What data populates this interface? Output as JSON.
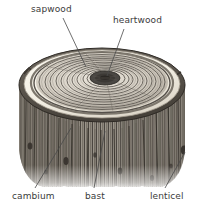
{
  "figure": {
    "style": "grayscale engraving / hatched line illustration",
    "background_color": "#ffffff",
    "width": 203,
    "height": 212
  },
  "labels": [
    {
      "id": "sapwood",
      "text": "sapwood",
      "position": "top-left",
      "leader_from": [
        63,
        18
      ],
      "leader_to": [
        86,
        67
      ]
    },
    {
      "id": "heartwood",
      "text": "heartwood",
      "position": "top-right",
      "leader_from": [
        124,
        29
      ],
      "leader_to": [
        107,
        76
      ]
    },
    {
      "id": "cambium",
      "text": "cambium",
      "position": "bottom-left",
      "leader_from": [
        35,
        188
      ],
      "leader_to": [
        71,
        128
      ]
    },
    {
      "id": "bast",
      "text": "bast",
      "position": "bottom-center",
      "leader_from": [
        94,
        188
      ],
      "leader_to": [
        105,
        131
      ]
    },
    {
      "id": "lenticel",
      "text": "lenticel",
      "position": "bottom-right",
      "leader_from": [
        165,
        188
      ],
      "leader_to": [
        185,
        152
      ]
    }
  ],
  "anatomy": {
    "heartwood": {
      "description": "dark elliptical core at centre of cut face",
      "center": [
        105,
        78
      ],
      "radius_x": 15,
      "radius_y": 7,
      "color": "#4a4743"
    },
    "sapwood": {
      "description": "pale concentric growth rings surrounding the heartwood",
      "ring_count": 11,
      "color": "#d9d4cb"
    },
    "cambium": {
      "description": "bright cream band at the outer rim of the cut face",
      "color": "#f4f0e6"
    },
    "bast": {
      "description": "inner bark layer just beneath the cambium",
      "color": "#8c867c"
    },
    "bark": {
      "description": "rough vertically striated outer bark of the trunk",
      "color": "#6e685f"
    },
    "lenticel": {
      "description": "dark pore spots on the bark surface",
      "color": "#3a3631",
      "spots": [
        [
          184,
          150
        ],
        [
          66,
          161
        ],
        [
          120,
          171
        ],
        [
          30,
          145
        ],
        [
          152,
          178
        ]
      ]
    }
  },
  "geometry": {
    "top_face_center": [
      102,
      85
    ],
    "top_face_radius_x": 83,
    "top_face_radius_y": 37,
    "trunk_bottom_y": 186
  },
  "colors": {
    "label_text": "#3b3b3b",
    "leader_line": "#4a4a4a",
    "ink_dark": "#3a3631",
    "ink_mid": "#77716a",
    "ink_light": "#c9c3b9",
    "paper": "#ffffff"
  }
}
